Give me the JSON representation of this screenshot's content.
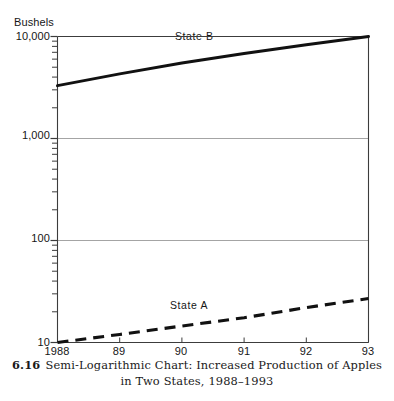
{
  "figure": {
    "number": "6.16",
    "caption_line_1": "Semi-Logarithmic Chart: Increased Production of Apples",
    "caption_line_2": "in Two States, 1988–1993"
  },
  "chart_data": {
    "type": "line",
    "title": "",
    "subtitle": "",
    "xlabel": "",
    "ylabel": "Bushels",
    "yscale": "log",
    "xscale": "linear",
    "grid": "horizontal-major-only",
    "legend": "inline-series-labels",
    "x": [
      1988,
      1989,
      1990,
      1991,
      1992,
      1993
    ],
    "xtick_labels": [
      "1988",
      "89",
      "90",
      "91",
      "92",
      "93"
    ],
    "ytick_labels": [
      "10,000",
      "1,000",
      "100",
      "10"
    ],
    "ytick_values": [
      10000,
      1000,
      100,
      10
    ],
    "ylim": [
      10,
      10000
    ],
    "xlim": [
      1988,
      1993
    ],
    "minor_ticks": [
      2,
      3,
      4,
      5,
      6,
      7,
      8,
      9
    ],
    "series": [
      {
        "name": "State B",
        "style": "solid",
        "color": "#111111",
        "label_x": 1990.0,
        "label_y": 7600,
        "values": [
          3300,
          4300,
          5500,
          6800,
          8300,
          10000
        ]
      },
      {
        "name": "State A",
        "style": "dashed",
        "color": "#111111",
        "label_x": 1989.9,
        "label_y": 20.5,
        "values": [
          10,
          12,
          14.5,
          17.5,
          22,
          27
        ]
      }
    ]
  },
  "colors": {
    "frame": "#3c3c3c",
    "grid": "#9a9a9a",
    "line": "#111111",
    "text": "#161616",
    "background": "#ffffff"
  }
}
